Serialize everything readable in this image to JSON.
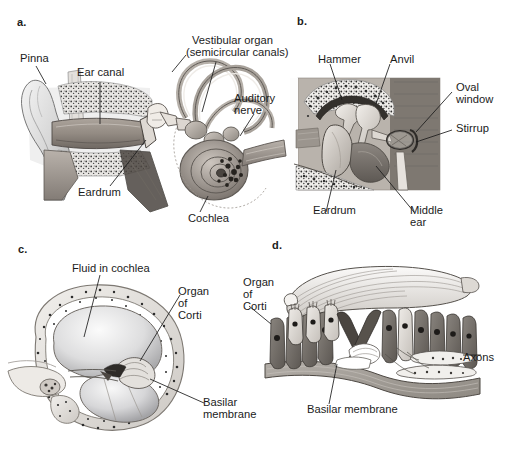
{
  "figure": {
    "background_color": "#ffffff",
    "ink_color": "#1b1b1b",
    "width": 511,
    "height": 464
  },
  "panels": [
    {
      "letter": "a.",
      "name": "overall-ear-anatomy",
      "labels": [
        {
          "text": "Pinna",
          "x": 20,
          "y": 55
        },
        {
          "text": "Ear canal",
          "x": 77,
          "y": 70
        },
        {
          "text": "Vestibular organ",
          "x": 192,
          "y": 39
        },
        {
          "text": "(semicircular canals)",
          "x": 186,
          "y": 51
        },
        {
          "text": "Auditory",
          "x": 234,
          "y": 96
        },
        {
          "text": "nerve",
          "x": 234,
          "y": 108
        },
        {
          "text": "Eardrum",
          "x": 78,
          "y": 190
        },
        {
          "text": "Cochlea",
          "x": 188,
          "y": 216
        }
      ]
    },
    {
      "letter": "b.",
      "name": "middle-ear-ossicles",
      "labels": [
        {
          "text": "Hammer",
          "x": 318,
          "y": 57
        },
        {
          "text": "Anvil",
          "x": 390,
          "y": 57
        },
        {
          "text": "Oval",
          "x": 456,
          "y": 85
        },
        {
          "text": "window",
          "x": 456,
          "y": 97
        },
        {
          "text": "Stirrup",
          "x": 456,
          "y": 126
        },
        {
          "text": "Eardrum",
          "x": 313,
          "y": 208
        },
        {
          "text": "Middle",
          "x": 410,
          "y": 208
        },
        {
          "text": "ear",
          "x": 410,
          "y": 220
        }
      ]
    },
    {
      "letter": "c.",
      "name": "cochlea-cross-section",
      "labels": [
        {
          "text": "Fluid in cochlea",
          "x": 72,
          "y": 266
        },
        {
          "text": "Organ",
          "x": 178,
          "y": 289
        },
        {
          "text": "of",
          "x": 178,
          "y": 301
        },
        {
          "text": "Corti",
          "x": 178,
          "y": 313
        },
        {
          "text": "Basilar",
          "x": 203,
          "y": 400
        },
        {
          "text": "membrane",
          "x": 203,
          "y": 412
        }
      ]
    },
    {
      "letter": "d.",
      "name": "organ-of-corti-detail",
      "labels": [
        {
          "text": "Organ",
          "x": 243,
          "y": 280
        },
        {
          "text": "of",
          "x": 243,
          "y": 292
        },
        {
          "text": "Corti",
          "x": 243,
          "y": 304
        },
        {
          "text": "Axons",
          "x": 463,
          "y": 355
        },
        {
          "text": "Basilar membrane",
          "x": 307,
          "y": 407
        }
      ]
    }
  ],
  "panel_letters": [
    {
      "text": "a.",
      "x": 17,
      "y": 22
    },
    {
      "text": "b.",
      "x": 297,
      "y": 21
    },
    {
      "text": "c.",
      "x": 18,
      "y": 249
    },
    {
      "text": "d.",
      "x": 272,
      "y": 245
    }
  ]
}
